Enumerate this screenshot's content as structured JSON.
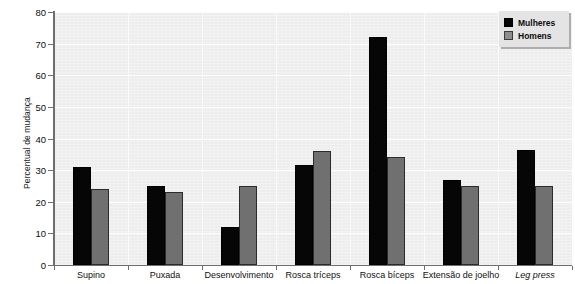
{
  "chart_data": {
    "type": "bar",
    "title": "",
    "xlabel": "",
    "ylabel": "Percentual de mudança",
    "ylim": [
      0,
      80
    ],
    "yticks": [
      0,
      10,
      20,
      30,
      40,
      50,
      60,
      70,
      80
    ],
    "ytick_labels": [
      "0",
      "10",
      "20",
      "30",
      "40",
      "50",
      "60",
      "70",
      "80"
    ],
    "grid": true,
    "legend_position": "top-right",
    "categories": [
      "Supino",
      "Puxada",
      "Desenvolvimento",
      "Rosca tríceps",
      "Rosca bíceps",
      "Extensão de joelho",
      "Leg press"
    ],
    "categories_italic": [
      false,
      false,
      false,
      false,
      false,
      false,
      true
    ],
    "series": [
      {
        "name": "Mulheres",
        "color": "#060606",
        "values": [
          31,
          25,
          12,
          31.5,
          72,
          27,
          36.5
        ]
      },
      {
        "name": "Homens",
        "color": "#707070",
        "values": [
          24,
          23,
          25,
          36,
          34,
          25,
          25
        ]
      }
    ]
  },
  "legend": {
    "items": [
      {
        "label": "Mulheres",
        "swatch": "legend-swatch-mulheres"
      },
      {
        "label": "Homens",
        "swatch": "legend-swatch-homens"
      }
    ]
  },
  "colors": {
    "plot_background": "#ededed",
    "gridline": "#fdfdfd",
    "axis": "#6e6e6e",
    "series_mulheres": "#060606",
    "series_homens": "#707070",
    "legend_background": "#e4e4e4"
  }
}
